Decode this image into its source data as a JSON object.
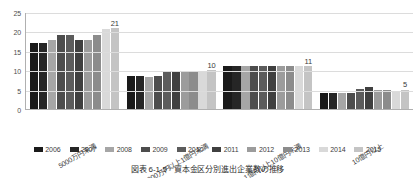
{
  "caption": {
    "number": "図表 6-1-5",
    "title": "資本金区分別進出企業数の推移"
  },
  "chart_data": {
    "type": "bar",
    "title": "資本金区分別進出企業数の推移",
    "xlabel": "",
    "ylabel": "",
    "ylim": [
      0,
      25
    ],
    "yticks": [
      "0",
      "5",
      "10",
      "15",
      "20",
      "25"
    ],
    "grid": true,
    "legend_position": "bottom",
    "categories": [
      "5000万円未満",
      "5000万円以上1億円未満",
      "1億円以上10億円未満",
      "10億円以上"
    ],
    "series": [
      {
        "name": "2006",
        "color": "#1a1a1a",
        "values": [
          17,
          8.5,
          11,
          4
        ]
      },
      {
        "name": "2007",
        "color": "#262626",
        "values": [
          17,
          8.5,
          11,
          4
        ]
      },
      {
        "name": "2008",
        "color": "#a6a6a6",
        "values": [
          17.8,
          8.3,
          11,
          4
        ]
      },
      {
        "name": "2009",
        "color": "#4d4d4d",
        "values": [
          19,
          8.5,
          11,
          4.2
        ]
      },
      {
        "name": "2010",
        "color": "#5c5c5c",
        "values": [
          19,
          9.8,
          11,
          5.2
        ]
      },
      {
        "name": "2011",
        "color": "#404040",
        "values": [
          17.9,
          9.8,
          11,
          5.6
        ]
      },
      {
        "name": "2012",
        "color": "#9c9c9c",
        "values": [
          17.8,
          9.5,
          11,
          4.9
        ]
      },
      {
        "name": "2013",
        "color": "#8c8c8c",
        "values": [
          19,
          9.8,
          11,
          4.9
        ]
      },
      {
        "name": "2014",
        "color": "#d9d9d9",
        "values": [
          20.7,
          9.8,
          11,
          4.6
        ]
      },
      {
        "name": "2015",
        "color": "#c4c4c4",
        "values": [
          20.8,
          10,
          11,
          5
        ]
      }
    ],
    "data_labels": [
      {
        "category_index": 0,
        "series_index": 9,
        "text": "21"
      },
      {
        "category_index": 1,
        "series_index": 9,
        "text": "10"
      },
      {
        "category_index": 2,
        "series_index": 9,
        "text": "11"
      },
      {
        "category_index": 3,
        "series_index": 9,
        "text": "5"
      }
    ]
  }
}
